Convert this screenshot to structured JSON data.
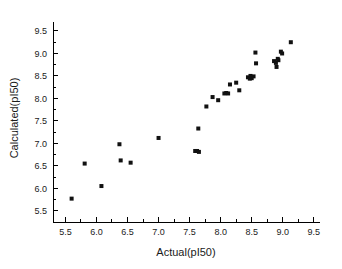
{
  "chart_data": {
    "type": "scatter",
    "title": "",
    "xlabel": "Actual(pI50)",
    "ylabel": "Calculated(pI50)",
    "xlim": [
      5.3,
      9.6
    ],
    "ylim": [
      5.25,
      9.7
    ],
    "xticks": [
      5.5,
      6.0,
      6.5,
      7.0,
      7.5,
      8.0,
      8.5,
      9.0,
      9.5
    ],
    "yticks": [
      5.5,
      6.0,
      6.5,
      7.0,
      7.5,
      8.0,
      8.5,
      9.0,
      9.5
    ],
    "xticklabels": [
      "5.5",
      "6.0",
      "6.5",
      "7.0",
      "7.5",
      "8.0",
      "8.5",
      "9.0",
      "9.5"
    ],
    "yticklabels": [
      "5.5",
      "6.0",
      "6.5",
      "7.0",
      "7.5",
      "8.0",
      "8.5",
      "9.0",
      "9.5"
    ],
    "minor_ticks": true,
    "grid": false,
    "legend": null,
    "marker": "square",
    "marker_color": "#111111",
    "marker_size": 4,
    "series": [
      {
        "name": "points",
        "points": [
          [
            5.6,
            5.77
          ],
          [
            5.81,
            6.55
          ],
          [
            6.08,
            6.05
          ],
          [
            6.37,
            6.98
          ],
          [
            6.39,
            6.62
          ],
          [
            6.55,
            6.57
          ],
          [
            7.0,
            7.12
          ],
          [
            7.59,
            6.83
          ],
          [
            7.62,
            6.83
          ],
          [
            7.65,
            6.81
          ],
          [
            7.64,
            7.33
          ],
          [
            7.77,
            7.82
          ],
          [
            7.87,
            8.03
          ],
          [
            7.96,
            7.96
          ],
          [
            8.06,
            8.11
          ],
          [
            8.09,
            8.12
          ],
          [
            8.12,
            8.11
          ],
          [
            8.15,
            8.31
          ],
          [
            8.25,
            8.35
          ],
          [
            8.3,
            8.18
          ],
          [
            8.44,
            8.47
          ],
          [
            8.47,
            8.44
          ],
          [
            8.48,
            8.5
          ],
          [
            8.5,
            8.45
          ],
          [
            8.53,
            8.49
          ],
          [
            8.56,
            9.02
          ],
          [
            8.57,
            8.78
          ],
          [
            8.86,
            8.83
          ],
          [
            8.89,
            8.79
          ],
          [
            8.9,
            8.7
          ],
          [
            8.92,
            8.88
          ],
          [
            8.93,
            8.85
          ],
          [
            8.97,
            9.04
          ],
          [
            8.99,
            9.0
          ],
          [
            9.13,
            9.25
          ]
        ]
      }
    ]
  }
}
